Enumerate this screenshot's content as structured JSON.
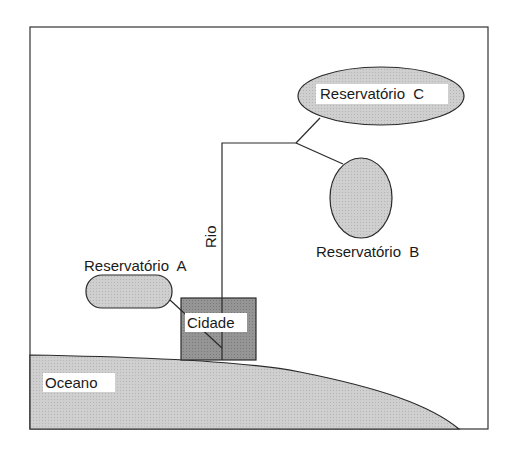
{
  "diagram": {
    "colors": {
      "background": "#ffffff",
      "frame": "#333333",
      "reservoir_fill": "#c8c8c8",
      "ocean_fill": "#cccccc",
      "city_fill": "#8f8f8f",
      "stroke": "#2a2a2a"
    },
    "labels": {
      "reservoir_a": "Reservatório  A",
      "reservoir_b": "Reservatório  B",
      "reservoir_c": "Reservatório  C",
      "river": "Rio",
      "city": "Cidade",
      "ocean": "Oceano"
    }
  }
}
